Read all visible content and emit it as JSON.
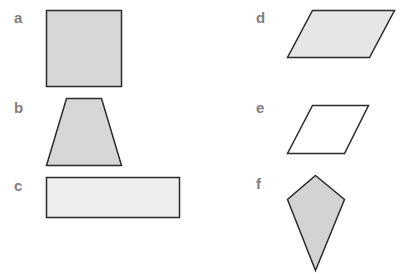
{
  "colors": {
    "stroke": "#2b2b2b",
    "fill_gray": "#d7d7d7",
    "fill_light": "#eeeeee",
    "fill_white": "#ffffff",
    "label": "#808080"
  },
  "shapes": [
    {
      "label": "a",
      "type": "square"
    },
    {
      "label": "b",
      "type": "trapezoid"
    },
    {
      "label": "c",
      "type": "rectangle"
    },
    {
      "label": "d",
      "type": "parallelogram"
    },
    {
      "label": "e",
      "type": "rhombus"
    },
    {
      "label": "f",
      "type": "kite"
    }
  ]
}
